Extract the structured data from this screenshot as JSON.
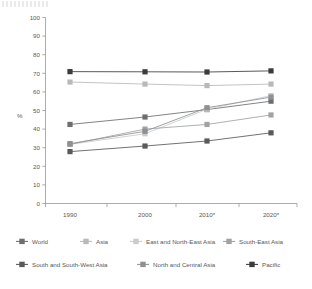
{
  "chart_data": {
    "type": "line",
    "title": "",
    "xlabel": "",
    "ylabel": "%",
    "ylim": [
      0,
      100
    ],
    "ytick_step": 10,
    "grid": false,
    "legend_position": "bottom",
    "categories": [
      "1990",
      "2000",
      "2010*",
      "2020*"
    ],
    "yticks": [
      "0",
      "10",
      "20",
      "30",
      "40",
      "50",
      "60",
      "70",
      "80",
      "90",
      "100"
    ],
    "series": [
      {
        "name": "World",
        "values": [
          42.5,
          46.5,
          50.5,
          55.0
        ],
        "color": "#6d6e70"
      },
      {
        "name": "Asia",
        "values": [
          65.3,
          64.2,
          63.4,
          64.2
        ],
        "color": "#b7b9bb"
      },
      {
        "name": "East and North-East Asia",
        "values": [
          31.8,
          37.5,
          50.7,
          58.0
        ],
        "color": "#c9cbcd"
      },
      {
        "name": "South-East Asia",
        "values": [
          31.8,
          40.0,
          42.5,
          47.6
        ],
        "color": "#a0a2a4"
      },
      {
        "name": "South and South-West Asia",
        "values": [
          27.9,
          30.9,
          33.6,
          38.0
        ],
        "color": "#58595b"
      },
      {
        "name": "North and Central Asia",
        "values": [
          32.2,
          38.8,
          51.5,
          57.2
        ],
        "color": "#8e9092"
      },
      {
        "name": "Pacific",
        "values": [
          70.9,
          70.8,
          70.7,
          71.3
        ],
        "color": "#3a3b3d"
      }
    ]
  },
  "legend": {
    "rows": [
      [
        "World",
        "Asia",
        "East and North-East Asia",
        "South-East Asia"
      ],
      [
        "South and South-West Asia",
        "North and Central Asia",
        "Pacific"
      ]
    ]
  },
  "icons": {
    "legend_marker": "square-marker-icon"
  }
}
